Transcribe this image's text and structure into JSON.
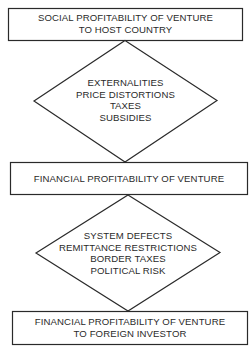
{
  "diagram": {
    "colors": {
      "stroke": "#2a2a2a",
      "text": "#2a2a2a",
      "background": "#ffffff"
    },
    "nodes": [
      {
        "id": "box1",
        "shape": "rectangle",
        "lines": [
          "SOCIAL PROFITABILITY OF VENTURE",
          "TO HOST COUNTRY"
        ]
      },
      {
        "id": "diamond1",
        "shape": "diamond",
        "lines": [
          "EXTERNALITIES",
          "PRICE DISTORTIONS",
          "TAXES",
          "SUBSIDIES"
        ]
      },
      {
        "id": "box2",
        "shape": "rectangle",
        "lines": [
          "FINANCIAL PROFITABILITY OF VENTURE"
        ]
      },
      {
        "id": "diamond2",
        "shape": "diamond",
        "lines": [
          "SYSTEM DEFECTS",
          "REMITTANCE RESTRICTIONS",
          "BORDER TAXES",
          "POLITICAL RISK"
        ]
      },
      {
        "id": "box3",
        "shape": "rectangle",
        "lines": [
          "FINANCIAL PROFITABILITY OF VENTURE",
          "TO FOREIGN INVESTOR"
        ]
      }
    ],
    "edges": [
      {
        "from": "box1",
        "to": "diamond1"
      },
      {
        "from": "diamond1",
        "to": "box2"
      },
      {
        "from": "box2",
        "to": "diamond2"
      },
      {
        "from": "diamond2",
        "to": "box3"
      }
    ]
  }
}
